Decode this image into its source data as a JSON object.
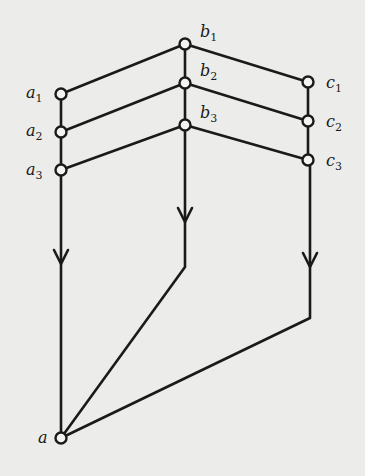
{
  "diagram": {
    "stroke_color": "#1a1a1a",
    "background": "#ececea",
    "nodes": [
      {
        "id": "b1",
        "label": "b",
        "sub": "1",
        "x": 185,
        "y": 44
      },
      {
        "id": "b2",
        "label": "b",
        "sub": "2",
        "x": 185,
        "y": 83
      },
      {
        "id": "b3",
        "label": "b",
        "sub": "3",
        "x": 185,
        "y": 125
      },
      {
        "id": "a1",
        "label": "a",
        "sub": "1",
        "x": 61,
        "y": 94
      },
      {
        "id": "a2",
        "label": "a",
        "sub": "2",
        "x": 61,
        "y": 132
      },
      {
        "id": "a3",
        "label": "a",
        "sub": "3",
        "x": 61,
        "y": 170
      },
      {
        "id": "c1",
        "label": "c",
        "sub": "1",
        "x": 308,
        "y": 82
      },
      {
        "id": "c2",
        "label": "c",
        "sub": "2",
        "x": 308,
        "y": 121
      },
      {
        "id": "c3",
        "label": "c",
        "sub": "3",
        "x": 308,
        "y": 160
      },
      {
        "id": "a",
        "label": "a",
        "sub": "",
        "x": 61,
        "y": 438
      }
    ],
    "edges": [
      {
        "from": "a1",
        "to": "b1"
      },
      {
        "from": "b1",
        "to": "c1"
      },
      {
        "from": "a2",
        "to": "b2"
      },
      {
        "from": "b2",
        "to": "c2"
      },
      {
        "from": "a3",
        "to": "b3"
      },
      {
        "from": "b3",
        "to": "c3"
      },
      {
        "from": "a1",
        "to": "a2"
      },
      {
        "from": "a2",
        "to": "a3"
      },
      {
        "from": "b1",
        "to": "b2"
      },
      {
        "from": "b2",
        "to": "b3"
      },
      {
        "from": "c1",
        "to": "c2"
      },
      {
        "from": "c2",
        "to": "c3"
      }
    ],
    "flows": [
      {
        "name": "left-flow",
        "path": "a3 -> a",
        "arrow_at": [
          61,
          262
        ]
      },
      {
        "name": "middle-flow",
        "path": "b3 -> (185,267) -> a",
        "arrow_at": [
          185,
          220
        ]
      },
      {
        "name": "right-flow",
        "path": "c3 -> (310,318) -> a",
        "arrow_at": [
          310,
          265
        ]
      }
    ],
    "labels": {
      "b1": "b",
      "b1_sub": "1",
      "b2": "b",
      "b2_sub": "2",
      "b3": "b",
      "b3_sub": "3",
      "a1": "a",
      "a1_sub": "1",
      "a2": "a",
      "a2_sub": "2",
      "a3": "a",
      "a3_sub": "3",
      "c1": "c",
      "c1_sub": "1",
      "c2": "c",
      "c2_sub": "2",
      "c3": "c",
      "c3_sub": "3",
      "a": "a"
    }
  }
}
